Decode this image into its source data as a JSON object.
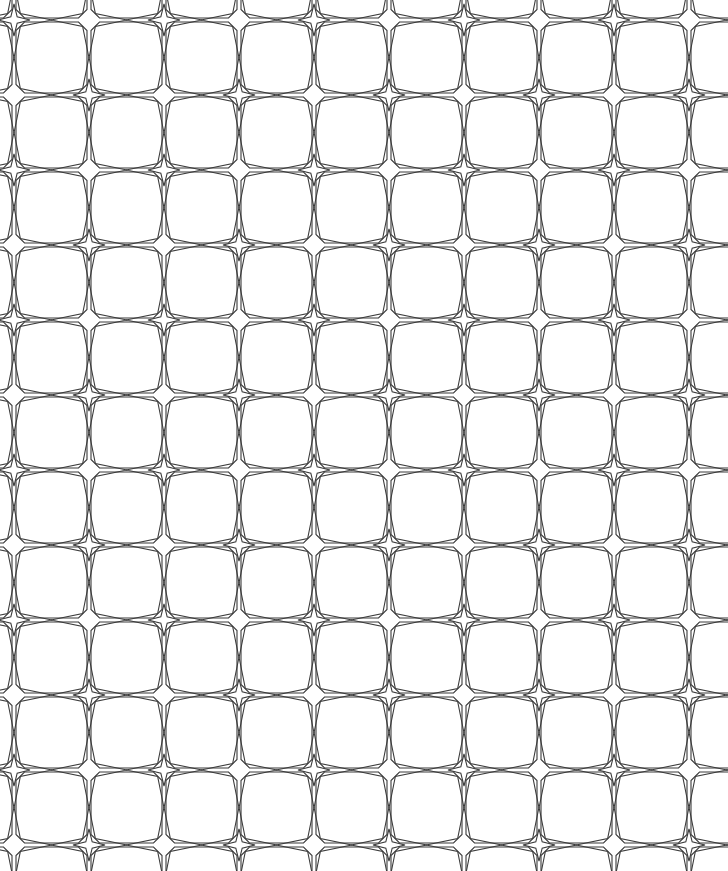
{
  "artwork": {
    "title": "Seamless Geometric Star Lattice Pattern",
    "type": "vector-line-pattern",
    "canvas": {
      "width": 728,
      "height": 871,
      "background_color": "#ffffff"
    },
    "stroke": {
      "color": "#3a3a3a",
      "width": 1.1,
      "linejoin": "miter",
      "fill": "none"
    },
    "tile": {
      "width": 150,
      "height": 150,
      "offset_x": -61,
      "offset_y": -55,
      "description": "Octagonal cells joined at four-pointed star pinch points; star types alternate in a checkerboard between plain outline and concentric double outline."
    },
    "motifs": [
      {
        "name": "octagon-cell",
        "count_per_tile": 4,
        "description": "Rounded octagon / hexagon-like cell occupying each quadrant of the tile"
      },
      {
        "name": "four-pointed-star-plain",
        "count_per_tile": 2,
        "description": "Single outline four pointed star at alternating lattice nodes"
      },
      {
        "name": "four-pointed-star-double",
        "count_per_tile": 2,
        "description": "Four pointed star with a concentric smaller star outline inside"
      }
    ],
    "star_geometry": {
      "outer_radius_vertical": 38,
      "outer_radius_horizontal": 38,
      "inner_radius": 9,
      "inner_star_outer_radius": 16,
      "inner_star_inner_radius": 4.5
    }
  }
}
